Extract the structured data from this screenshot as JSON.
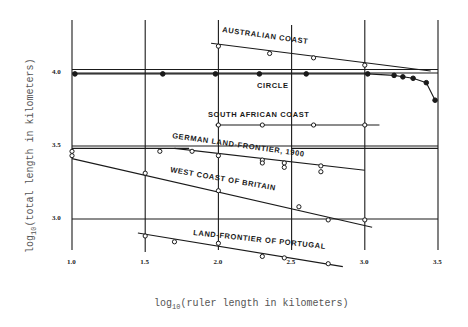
{
  "chart_data": {
    "type": "scatter",
    "title": "",
    "xlabel": "log10(ruler length in kilometers)",
    "ylabel": "log10(total length in kilometers)",
    "xlabel_parts": {
      "prefix": "log",
      "sub": "10",
      "rest": "(ruler length in kilometers)"
    },
    "ylabel_parts": {
      "prefix": "log",
      "sub": "10",
      "rest": "(total length in kilometers)"
    },
    "xlim": [
      1.0,
      3.5
    ],
    "ylim": [
      2.65,
      4.25
    ],
    "x_ticks": [
      "1.0",
      "1.5",
      "2.0",
      "2.5",
      "3.0",
      "3.5"
    ],
    "y_ticks": [
      "4.0",
      "3.5",
      "3.0"
    ],
    "grid": true,
    "legend": "none (series labeled inline)",
    "series": [
      {
        "name": "AUSTRALIAN COAST",
        "marker": "open",
        "points": [
          [
            2.0,
            4.17
          ],
          [
            2.35,
            4.12
          ],
          [
            2.65,
            4.09
          ],
          [
            3.0,
            4.04
          ]
        ],
        "fit": [
          [
            1.95,
            4.19
          ],
          [
            3.45,
            4.0
          ]
        ]
      },
      {
        "name": "CIRCLE",
        "marker": "filled",
        "points": [
          [
            1.02,
            3.98
          ],
          [
            1.62,
            3.98
          ],
          [
            1.98,
            3.98
          ],
          [
            2.28,
            3.98
          ],
          [
            2.6,
            3.98
          ],
          [
            3.02,
            3.98
          ],
          [
            3.2,
            3.97
          ],
          [
            3.26,
            3.96
          ],
          [
            3.33,
            3.95
          ],
          [
            3.42,
            3.92
          ],
          [
            3.48,
            3.8
          ]
        ]
      },
      {
        "name": "SOUTH AFRICAN COAST",
        "marker": "open",
        "points": [
          [
            2.0,
            3.63
          ],
          [
            2.3,
            3.63
          ],
          [
            2.65,
            3.63
          ],
          [
            3.0,
            3.63
          ]
        ],
        "fit": [
          [
            1.98,
            3.63
          ],
          [
            3.1,
            3.63
          ]
        ]
      },
      {
        "name": "GERMAN LAND-FRONTIER, 1900",
        "marker": "open",
        "points": [
          [
            1.0,
            3.45
          ],
          [
            1.6,
            3.45
          ],
          [
            1.82,
            3.45
          ],
          [
            2.0,
            3.42
          ],
          [
            2.3,
            3.39
          ],
          [
            2.3,
            3.37
          ],
          [
            2.45,
            3.37
          ],
          [
            2.45,
            3.34
          ],
          [
            2.7,
            3.35
          ],
          [
            2.7,
            3.31
          ]
        ],
        "fit": [
          [
            1.7,
            3.47
          ],
          [
            3.0,
            3.32
          ]
        ]
      },
      {
        "name": "WEST COAST OF BRITAIN",
        "marker": "open",
        "points": [
          [
            1.0,
            3.42
          ],
          [
            1.5,
            3.3
          ],
          [
            2.0,
            3.18
          ],
          [
            2.55,
            3.07
          ],
          [
            2.75,
            2.98
          ],
          [
            3.0,
            2.98
          ]
        ],
        "fit": [
          [
            1.0,
            3.4
          ],
          [
            3.05,
            2.93
          ]
        ]
      },
      {
        "name": "LAND-FRONTIER OF PORTUGAL",
        "marker": "open",
        "points": [
          [
            1.5,
            2.87
          ],
          [
            1.7,
            2.83
          ],
          [
            2.0,
            2.82
          ],
          [
            2.3,
            2.73
          ],
          [
            2.45,
            2.72
          ],
          [
            2.75,
            2.68
          ]
        ],
        "fit": [
          [
            1.45,
            2.89
          ],
          [
            2.85,
            2.66
          ]
        ]
      }
    ],
    "extra_reference_lines": [
      {
        "from": [
          1.0,
          4.01
        ],
        "to": [
          3.5,
          4.01
        ]
      },
      {
        "from": [
          1.0,
          3.47
        ],
        "to": [
          1.8,
          3.47
        ]
      },
      {
        "from": [
          2.5,
          3.47
        ],
        "to": [
          3.5,
          3.47
        ]
      }
    ]
  }
}
